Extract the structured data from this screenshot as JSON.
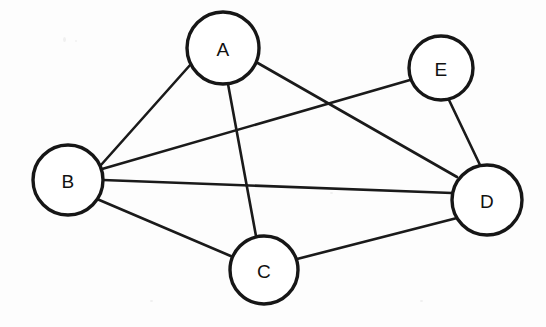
{
  "diagram": {
    "type": "undirected-graph",
    "canvas": {
      "width": 546,
      "height": 327
    },
    "style": {
      "background_color": "#fdfdfd",
      "node_fill": "#ffffff",
      "node_stroke": "#161616",
      "node_stroke_width": 3.4,
      "edge_color": "#1a1a1a",
      "edge_width": 2.6,
      "label_color": "#111111",
      "label_font_size": 19
    },
    "nodes": [
      {
        "id": "A",
        "label": "A",
        "cx": 223,
        "cy": 48,
        "r": 36,
        "degree": 3
      },
      {
        "id": "B",
        "label": "B",
        "cx": 68,
        "cy": 180,
        "r": 35,
        "degree": 4
      },
      {
        "id": "C",
        "label": "C",
        "cx": 264,
        "cy": 270,
        "r": 34,
        "degree": 3
      },
      {
        "id": "D",
        "label": "D",
        "cx": 487,
        "cy": 200,
        "r": 35,
        "degree": 4
      },
      {
        "id": "E",
        "label": "E",
        "cx": 441,
        "cy": 68,
        "r": 32,
        "degree": 2
      }
    ],
    "edges": [
      {
        "id": "A-B",
        "source": "A",
        "target": "B",
        "x1": 191,
        "y1": 64,
        "x2": 101,
        "y2": 165
      },
      {
        "id": "A-C",
        "source": "A",
        "target": "C",
        "x1": 228,
        "y1": 84,
        "x2": 256,
        "y2": 236
      },
      {
        "id": "A-D",
        "source": "A",
        "target": "D",
        "x1": 256,
        "y1": 62,
        "x2": 457,
        "y2": 177
      },
      {
        "id": "B-E",
        "source": "B",
        "target": "E",
        "x1": 102,
        "y1": 169,
        "x2": 410,
        "y2": 80
      },
      {
        "id": "B-D",
        "source": "B",
        "target": "D",
        "x1": 103,
        "y1": 180,
        "x2": 452,
        "y2": 193
      },
      {
        "id": "B-C",
        "source": "B",
        "target": "C",
        "x1": 97,
        "y1": 199,
        "x2": 233,
        "y2": 257
      },
      {
        "id": "C-D",
        "source": "C",
        "target": "D",
        "x1": 297,
        "y1": 259,
        "x2": 457,
        "y2": 218
      },
      {
        "id": "E-D",
        "source": "E",
        "target": "D",
        "x1": 449,
        "y1": 100,
        "x2": 480,
        "y2": 165
      }
    ],
    "crossings": [
      {
        "id": "cross-AD-BE",
        "edges": [
          "A-D",
          "B-E"
        ],
        "x": 313,
        "y": 105
      },
      {
        "id": "cross-AC-BE",
        "edges": [
          "A-C",
          "B-E"
        ],
        "x": 233,
        "y": 129
      },
      {
        "id": "cross-AC-BD",
        "edges": [
          "A-C",
          "B-D"
        ],
        "x": 240,
        "y": 185
      }
    ]
  }
}
